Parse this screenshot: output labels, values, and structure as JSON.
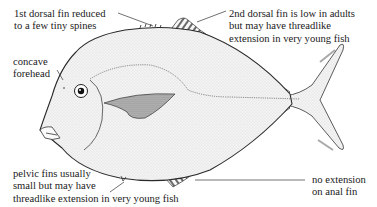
{
  "diagram": {
    "labels": {
      "first_dorsal": {
        "lines": [
          "1st dorsal fin reduced",
          "to a few tiny spines"
        ]
      },
      "second_dorsal": {
        "lines": [
          "2nd dorsal fin is low in adults",
          "but may have threadlike",
          "extension in very young fish"
        ]
      },
      "forehead": {
        "lines": [
          "concave",
          "forehead"
        ]
      },
      "pelvic": {
        "lines": [
          "pelvic fins usually",
          "small but may have",
          "threadlike extension in very young fish"
        ]
      },
      "anal": {
        "lines": [
          "no extension",
          "on anal fin"
        ]
      }
    },
    "colors": {
      "ink": "#1a1a1a",
      "body_fill": "#f4f4f4",
      "shade": "#8a8a8a",
      "background": "#ffffff"
    }
  }
}
